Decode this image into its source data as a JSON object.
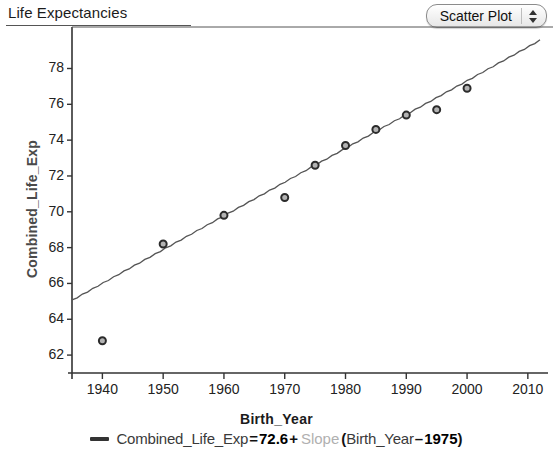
{
  "header": {
    "title": "Life Expectancies",
    "plot_type_selector": {
      "value": "Scatter Plot",
      "up_arrow_icon": "triangle-up-icon",
      "down_arrow_icon": "triangle-down-icon"
    }
  },
  "axes": {
    "x_label": "Birth_Year",
    "y_label": "Combined_Life_Exp",
    "x_ticks": [
      "1940",
      "1950",
      "1960",
      "1970",
      "1980",
      "1990",
      "2000",
      "2010"
    ],
    "y_ticks": [
      "78",
      "76",
      "74",
      "72",
      "70",
      "68",
      "66",
      "64",
      "62"
    ]
  },
  "equation": {
    "marker_icon": "line-legend-icon",
    "response": "Combined_Life_Exp",
    "equals": "=",
    "intercept": "72.6",
    "plus": "+",
    "slope_placeholder": "Slope",
    "open_paren": "(",
    "predictor": "Birth_Year",
    "minus": "–",
    "center": "1975",
    "close_paren": ")"
  },
  "chart_data": {
    "type": "scatter",
    "title": "Life Expectancies",
    "xlabel": "Birth_Year",
    "ylabel": "Combined_Life_Exp",
    "xlim": [
      1935,
      2012
    ],
    "ylim": [
      61.0,
      79.2
    ],
    "x_ticks": [
      1940,
      1950,
      1960,
      1970,
      1980,
      1990,
      2000,
      2010
    ],
    "y_ticks": [
      62,
      64,
      66,
      68,
      70,
      72,
      74,
      76,
      78
    ],
    "grid": false,
    "legend_position": "below-axes",
    "marker": {
      "shape": "circle",
      "fill": "#b3b3b3",
      "edge": "#2b2b2b",
      "size": 7
    },
    "series": [
      {
        "name": "Combined_Life_Exp",
        "x": [
          1940,
          1950,
          1960,
          1970,
          1975,
          1980,
          1985,
          1990,
          1995,
          2000
        ],
        "y": [
          62.8,
          68.2,
          69.8,
          70.8,
          72.6,
          73.7,
          74.6,
          75.4,
          75.7,
          76.9
        ]
      }
    ],
    "fit_line": {
      "name": "Combined_Life_Exp = 72.6 + Slope (Birth_Year - 1975)",
      "intercept_at_1975": 72.6,
      "slope": 0.1885,
      "x_start": 1935,
      "x_end": 2012,
      "y_start": 64.4,
      "y_end": 79.6,
      "color": "#555555"
    }
  }
}
